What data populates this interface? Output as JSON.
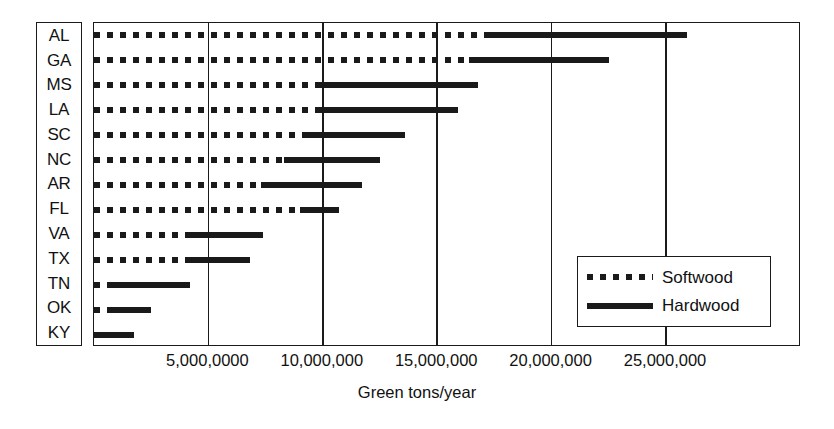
{
  "chart_data": {
    "type": "bar",
    "orientation": "horizontal",
    "stacked": true,
    "title": "",
    "xlabel": "Green tons/year",
    "ylabel": "",
    "xlim": [
      0,
      30900000
    ],
    "grid": "vertical",
    "xticks": [
      5000000,
      10000000,
      15000000,
      20000000,
      25000000
    ],
    "xtick_labels": [
      "5,000,0000",
      "10,000,000",
      "15,000,000",
      "20,000,000",
      "25,000,000"
    ],
    "categories": [
      "AL",
      "GA",
      "MS",
      "LA",
      "SC",
      "NC",
      "AR",
      "FL",
      "VA",
      "TX",
      "TN",
      "OK",
      "KY"
    ],
    "legend": {
      "position": "lower-right",
      "entries": [
        {
          "name": "Softwood",
          "style": "dotted"
        },
        {
          "name": "Hardwood",
          "style": "solid"
        }
      ]
    },
    "series": [
      {
        "name": "Softwood",
        "style": "dotted",
        "values": [
          17200000,
          16400000,
          9800000,
          9700000,
          9100000,
          8300000,
          7300000,
          9000000,
          4000000,
          4100000,
          750000,
          750000,
          0
        ]
      },
      {
        "name": "Hardwood",
        "style": "solid",
        "values": [
          8700000,
          6100000,
          7000000,
          6200000,
          4500000,
          4200000,
          4400000,
          1700000,
          3400000,
          2700000,
          3450000,
          1750000,
          1750000
        ]
      }
    ],
    "totals": [
      25900000,
      22500000,
      16800000,
      15900000,
      13600000,
      12500000,
      11700000,
      10700000,
      7400000,
      6800000,
      4200000,
      2500000,
      1750000
    ],
    "bars": [
      {
        "category": "AL",
        "soft_start": 0,
        "soft_end": 17200000,
        "hard_start": 17200000,
        "hard_end": 25900000
      },
      {
        "category": "GA",
        "soft_start": 0,
        "soft_end": 16400000,
        "hard_start": 16400000,
        "hard_end": 22500000
      },
      {
        "category": "MS",
        "soft_start": 0,
        "soft_end": 9800000,
        "hard_start": 9800000,
        "hard_end": 16800000
      },
      {
        "category": "LA",
        "soft_start": 0,
        "soft_end": 9700000,
        "hard_start": 9700000,
        "hard_end": 15900000
      },
      {
        "category": "SC",
        "soft_start": 0,
        "soft_end": 9100000,
        "hard_start": 9100000,
        "hard_end": 13600000
      },
      {
        "category": "NC",
        "soft_start": 0,
        "soft_end": 8300000,
        "hard_start": 8300000,
        "hard_end": 12500000
      },
      {
        "category": "AR",
        "soft_start": 0,
        "soft_end": 7300000,
        "hard_start": 7300000,
        "hard_end": 11700000
      },
      {
        "category": "FL",
        "soft_start": 0,
        "soft_end": 9000000,
        "hard_start": 9000000,
        "hard_end": 10700000
      },
      {
        "category": "VA",
        "soft_start": 0,
        "soft_end": 4000000,
        "hard_start": 4000000,
        "hard_end": 7400000
      },
      {
        "category": "TX",
        "soft_start": 0,
        "soft_end": 4100000,
        "hard_start": 4100000,
        "hard_end": 6800000
      },
      {
        "category": "TN",
        "soft_start": 0,
        "soft_end": 750000,
        "hard_start": 750000,
        "hard_end": 4200000
      },
      {
        "category": "OK",
        "soft_start": 0,
        "soft_end": 750000,
        "hard_start": 750000,
        "hard_end": 2500000
      },
      {
        "category": "KY",
        "soft_start": 0,
        "soft_end": 0,
        "hard_start": 0,
        "hard_end": 1750000
      }
    ]
  },
  "colors": {
    "ink": "#1a1a1a",
    "background": "#ffffff"
  }
}
